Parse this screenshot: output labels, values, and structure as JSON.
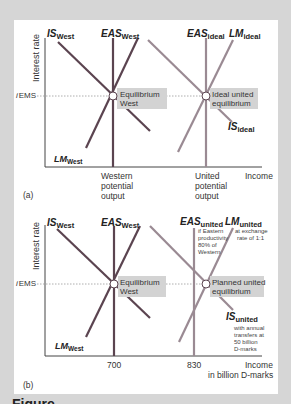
{
  "colors": {
    "background": "#d6d6d6",
    "card": "#ffffff",
    "west_line": "#5b4450",
    "united_line": "#9a8a93",
    "label_box": "#d3d3d3",
    "axis": "#444444",
    "text": "#222222"
  },
  "panel_a": {
    "tag": "(a)",
    "y_axis_label": "Interest rate",
    "x_axis_label": "Income",
    "i_label_italic": "i",
    "i_label_sub": "EMS",
    "curves": {
      "is_west": {
        "main": "IS",
        "sub": "West"
      },
      "eas_west": {
        "main": "EAS",
        "sub": "West"
      },
      "lm_west": {
        "main": "LM",
        "sub": "West"
      },
      "eas_ideal": {
        "main": "EAS",
        "sub": "ideal"
      },
      "lm_ideal": {
        "main": "LM",
        "sub": "ideal"
      },
      "is_ideal": {
        "main": "IS",
        "sub": "ideal"
      }
    },
    "points": {
      "west": {
        "line1": "Equilibrium",
        "line2": "West"
      },
      "ideal": {
        "line1": "Ideal united",
        "line2": "equilibrium"
      }
    },
    "x_ticks": {
      "western": {
        "line1": "Western",
        "line2": "potential",
        "line3": "output"
      },
      "united": {
        "line1": "United",
        "line2": "potential",
        "line3": "output"
      }
    }
  },
  "panel_b": {
    "tag": "(b)",
    "y_axis_label": "Interest rate",
    "x_axis_label_line1": "Income",
    "x_axis_label_line2": "in billion D-marks",
    "i_label_italic": "i",
    "i_label_sub": "EMS",
    "curves": {
      "is_west": {
        "main": "IS",
        "sub": "West"
      },
      "eas_west": {
        "main": "EAS",
        "sub": "West"
      },
      "lm_west": {
        "main": "LM",
        "sub": "West"
      },
      "eas_united": {
        "main": "EAS",
        "sub": "united",
        "note1": "if Eastern",
        "note2": "productivity",
        "note3": "80% of",
        "note4": "Western"
      },
      "lm_united": {
        "main": "LM",
        "sub": "united",
        "note1": "at exchange",
        "note2": "rate of 1:1"
      },
      "is_united": {
        "main": "IS",
        "sub": "united",
        "note1": "with annual",
        "note2": "transfers at",
        "note3": "50 billion",
        "note4": "D-marks"
      }
    },
    "points": {
      "west": {
        "line1": "Equilibrium",
        "line2": "West"
      },
      "planned": {
        "line1": "Planned united",
        "line2": "equilibrium"
      }
    },
    "x_ticks": {
      "west": "700",
      "united": "830"
    }
  },
  "caption_peek": "Figure"
}
